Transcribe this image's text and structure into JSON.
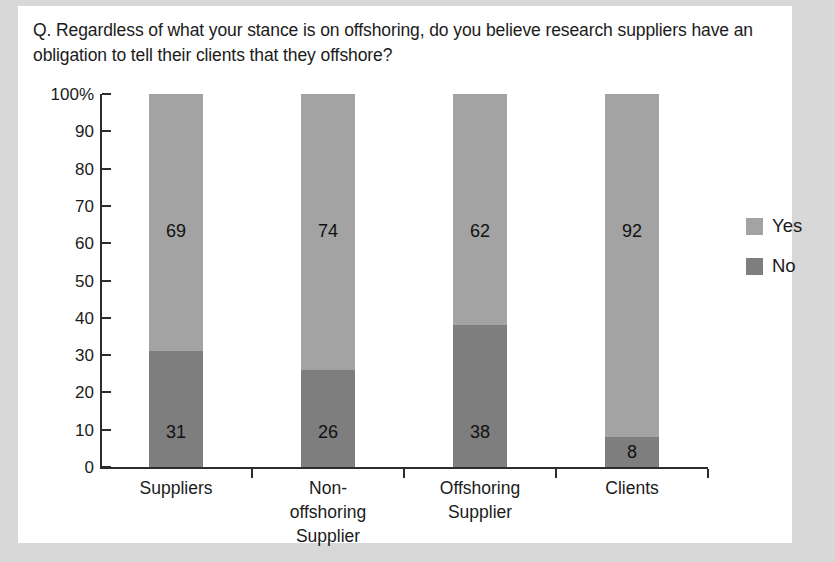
{
  "card": {
    "background": "#ffffff",
    "page_background": "#d8d8d8"
  },
  "question": "Q. Regardless of what your stance is on offshoring, do you believe research suppliers have an obligation to tell their clients that they offshore?",
  "legend": {
    "position": "right",
    "items": [
      {
        "label": "Yes",
        "color": "#a3a3a3"
      },
      {
        "label": "No",
        "color": "#7e7e7e"
      }
    ]
  },
  "axis": {
    "y_ticks": [
      "100%",
      "90",
      "80",
      "70",
      "60",
      "50",
      "40",
      "30",
      "20",
      "10",
      "0"
    ],
    "y_min": 0,
    "y_max": 100
  },
  "chart_data": {
    "type": "bar",
    "subtype": "stacked-100-percent",
    "title": "Q. Regardless of what your stance is on offshoring, do you believe research suppliers have an obligation to tell their clients that they offshore?",
    "xlabel": "",
    "ylabel": "",
    "ylim": [
      0,
      100
    ],
    "grid": false,
    "legend_position": "right",
    "categories": [
      "Suppliers",
      "Non-offshoring Supplier",
      "Offshoring Supplier",
      "Clients"
    ],
    "category_lines": [
      [
        "Suppliers"
      ],
      [
        "Non-",
        "offshoring",
        "Supplier"
      ],
      [
        "Offshoring",
        "Supplier"
      ],
      [
        "Clients"
      ]
    ],
    "series": [
      {
        "name": "Yes",
        "color": "#a3a3a3",
        "values": [
          69,
          74,
          62,
          92
        ]
      },
      {
        "name": "No",
        "color": "#7e7e7e",
        "values": [
          31,
          26,
          38,
          8
        ]
      }
    ],
    "tick_labels": [
      "100%",
      "90",
      "80",
      "70",
      "60",
      "50",
      "40",
      "30",
      "20",
      "10",
      "0"
    ]
  }
}
